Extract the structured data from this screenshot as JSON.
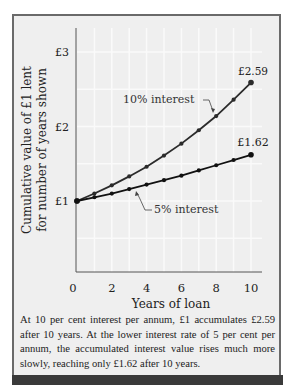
{
  "chart_data": {
    "type": "line",
    "title": "",
    "xlabel": "Years of loan",
    "ylabel": "Cumulative value of £1 lent for number of years shown",
    "x": [
      0,
      1,
      2,
      3,
      4,
      5,
      6,
      7,
      8,
      9,
      10
    ],
    "xticks": [
      0,
      2,
      4,
      6,
      8,
      10
    ],
    "xtick_labels": [
      "0",
      "2",
      "4",
      "6",
      "8",
      "10"
    ],
    "yticks": [
      1,
      2,
      3
    ],
    "ytick_labels": [
      "£1",
      "£2",
      "£3"
    ],
    "xlim": [
      0,
      10.5
    ],
    "ylim": [
      0.05,
      3.35
    ],
    "grid": true,
    "series": [
      {
        "name": "10% interest",
        "values": [
          1.0,
          1.1,
          1.21,
          1.33,
          1.46,
          1.61,
          1.77,
          1.95,
          2.14,
          2.36,
          2.59
        ],
        "end_label": "£2.59",
        "color": "#2b2b2b"
      },
      {
        "name": "5% interest",
        "values": [
          1.0,
          1.05,
          1.1,
          1.16,
          1.22,
          1.28,
          1.34,
          1.41,
          1.48,
          1.55,
          1.62
        ],
        "end_label": "£1.62",
        "color": "#111111"
      }
    ],
    "annotations": [
      {
        "text": "10% interest",
        "series": "10% interest"
      },
      {
        "text": "5% interest",
        "series": "5% interest"
      },
      {
        "text": "£2.59",
        "at": [
          10,
          2.59
        ]
      },
      {
        "text": "£1.62",
        "at": [
          10,
          1.62
        ]
      }
    ]
  },
  "labels": {
    "ylabel_line1": "Cumulative value of £1 lent",
    "ylabel_line2": "for number of years shown",
    "xlabel": "Years of loan",
    "annot_10": "10% interest",
    "annot_5": "5% interest",
    "end_10": "£2.59",
    "end_5": "£1.62"
  },
  "caption": "At 10 per cent interest per annum, £1 accumulates £2.59 after 10 years. At the lower interest rate of 5 per cent per annum, the accumulated interest value rises much more slowly, reaching only £1.62 after 10 years.",
  "colors": {
    "panel_bg": "#efefef",
    "frame": "#6a6a6a",
    "grid": "#fafafa",
    "line_10": "#2b2b2b",
    "line_5": "#111111"
  }
}
